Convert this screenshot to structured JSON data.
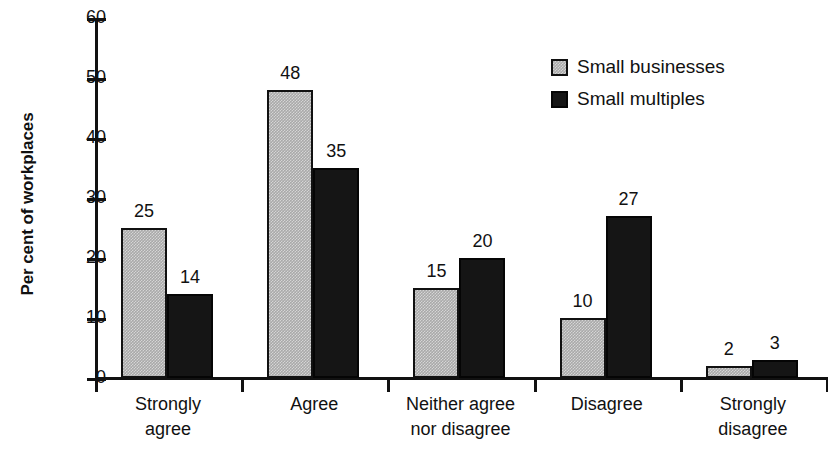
{
  "chart_data": {
    "type": "bar",
    "title": "",
    "subtitle": "",
    "xlabel": "",
    "ylabel": "Per cent of workplaces",
    "ylim": [
      0,
      60
    ],
    "yticks": [
      0,
      10,
      20,
      30,
      40,
      50,
      60
    ],
    "ytick_labels": [
      "0",
      "10",
      "20",
      "30",
      "40",
      "50",
      "60"
    ],
    "grid": false,
    "legend_position": "top-right",
    "categories": [
      "Strongly agree",
      "Agree",
      "Neither agree nor disagree",
      "Disagree",
      "Strongly disagree"
    ],
    "category_lines": [
      [
        "Strongly",
        "agree"
      ],
      [
        "Agree"
      ],
      [
        "Neither agree",
        "nor disagree"
      ],
      [
        "Disagree"
      ],
      [
        "Strongly",
        "disagree"
      ]
    ],
    "series": [
      {
        "name": "Small businesses",
        "color": "#a9a9a9",
        "values": [
          25,
          48,
          15,
          10,
          2
        ],
        "labels": [
          "25",
          "48",
          "15",
          "10",
          "2"
        ]
      },
      {
        "name": "Small multiples",
        "color": "#151515",
        "values": [
          14,
          35,
          20,
          27,
          3
        ],
        "labels": [
          "14",
          "35",
          "20",
          "27",
          "3"
        ]
      }
    ]
  },
  "legend": {
    "entries": [
      {
        "label": "Small businesses",
        "swatch": "gray-square-swatch"
      },
      {
        "label": "Small multiples",
        "swatch": "black-square-swatch"
      }
    ]
  },
  "colors": {
    "series_small_businesses": "#a9a9a9",
    "series_small_multiples": "#151515",
    "axis": "#111111",
    "background": "#ffffff"
  }
}
